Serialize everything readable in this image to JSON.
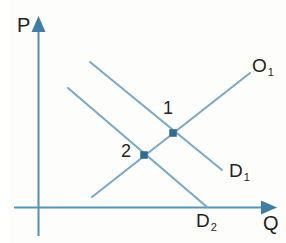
{
  "figure": {
    "kind": "supply-demand-diagram",
    "axes": {
      "y_axis_label": "P",
      "x_axis_label": "Q",
      "y_axis_meaning": "Price",
      "x_axis_meaning": "Quantity"
    },
    "curves": [
      {
        "id": "supply",
        "label_base": "O",
        "label_sub": "1",
        "label_full": "O₁",
        "slope": "upward",
        "from": [
          92,
          197
        ],
        "to": [
          250,
          73
        ]
      },
      {
        "id": "demand-1",
        "label_base": "D",
        "label_sub": "1",
        "label_full": "D₁",
        "slope": "downward",
        "from": [
          90,
          62
        ],
        "to": [
          222,
          170
        ]
      },
      {
        "id": "demand-2",
        "label_base": "D",
        "label_sub": "2",
        "label_full": "D₂",
        "slope": "downward",
        "from": [
          68,
          88
        ],
        "to": [
          207,
          207
        ]
      }
    ],
    "equilibria": [
      {
        "id": "point-1",
        "label": "1",
        "x": 173,
        "y": 133,
        "on": [
          "supply",
          "demand-1"
        ]
      },
      {
        "id": "point-2",
        "label": "2",
        "x": 144,
        "y": 155,
        "on": [
          "supply",
          "demand-2"
        ]
      }
    ],
    "colors": {
      "line": "#4a87ad",
      "line_light": "#7aa8c4",
      "marker": "#2f6b8f",
      "text": "#231f20",
      "background": "#fdfdfb",
      "gutter": "#ffffff"
    }
  },
  "chart_data": {
    "type": "line",
    "title": "",
    "xlabel": "Q",
    "ylabel": "P",
    "grid": false,
    "legend": "inline-curve-labels",
    "axis_arrows": true,
    "xlim": [
      0,
      10
    ],
    "ylim": [
      0,
      10
    ],
    "series": [
      {
        "name": "O₁",
        "role": "supply",
        "x": [
          2.3,
          9.2
        ],
        "y": [
          0.5,
          7.1
        ],
        "annotation": "O₁"
      },
      {
        "name": "D₁",
        "role": "demand-after-shift",
        "x": [
          2.2,
          7.8
        ],
        "y": [
          7.7,
          2.0
        ],
        "annotation": "D₁"
      },
      {
        "name": "D₂",
        "role": "demand-before-shift",
        "x": [
          1.3,
          7.2
        ],
        "y": [
          6.3,
          0.0
        ],
        "annotation": "D₂"
      }
    ],
    "points": [
      {
        "label": "1",
        "x": 7.0,
        "y": 3.9,
        "note": "equilibrium of O₁ and D₁"
      },
      {
        "label": "2",
        "x": 5.6,
        "y": 2.7,
        "note": "equilibrium of O₁ and D₂"
      }
    ]
  }
}
